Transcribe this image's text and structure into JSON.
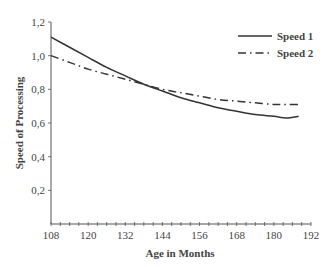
{
  "chart_data": {
    "type": "line",
    "title": "",
    "xlabel": "Age in Months",
    "ylabel": "Speed of Processing",
    "xlim": [
      108,
      192
    ],
    "ylim": [
      0,
      1.2
    ],
    "x_ticks": [
      "108",
      "120",
      "132",
      "144",
      "156",
      "168",
      "180",
      "192"
    ],
    "y_ticks": [
      "0,2",
      "0,4",
      "0,6",
      "0,8",
      "1,0",
      "1,2"
    ],
    "grid": false,
    "legend_position": "top-right",
    "x": [
      108,
      114,
      120,
      126,
      132,
      138,
      144,
      150,
      156,
      162,
      168,
      174,
      180,
      184,
      188
    ],
    "series": [
      {
        "name": "Speed 1",
        "style": "solid",
        "values": [
          1.11,
          1.05,
          0.99,
          0.93,
          0.88,
          0.83,
          0.79,
          0.75,
          0.72,
          0.69,
          0.67,
          0.65,
          0.64,
          0.63,
          0.64
        ]
      },
      {
        "name": "Speed 2",
        "style": "dash-dot",
        "values": [
          1.0,
          0.96,
          0.92,
          0.89,
          0.86,
          0.83,
          0.8,
          0.78,
          0.76,
          0.74,
          0.73,
          0.72,
          0.71,
          0.71,
          0.71
        ]
      }
    ],
    "colors": {
      "line": "#333333",
      "axis": "#555555"
    }
  }
}
